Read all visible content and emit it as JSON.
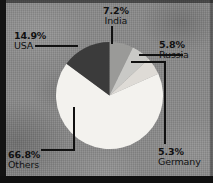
{
  "chart_data": {
    "type": "pie",
    "title": "",
    "subtitle": "",
    "xlabel": "",
    "ylabel": "",
    "legend_position": "none",
    "grid": false,
    "value_unit": "%",
    "start_angle_deg": 0,
    "direction": "clockwise",
    "categories": [
      "India",
      "Russia",
      "Germany",
      "Others",
      "USA"
    ],
    "values": [
      7.2,
      5.8,
      5.3,
      66.8,
      14.9
    ],
    "slices": [
      {
        "label": "India",
        "value": 7.2,
        "display": "7.2%",
        "color": "#9a9a98",
        "leader": "vertical-up"
      },
      {
        "label": "Russia",
        "value": 5.8,
        "display": "5.8%",
        "color": "#c9c9c6",
        "leader": "horizontal-right"
      },
      {
        "label": "Germany",
        "value": 5.3,
        "display": "5.3%",
        "color": "#dedbd6",
        "leader": "right-then-down"
      },
      {
        "label": "Others",
        "value": 66.8,
        "display": "66.8%",
        "color": "#f3f2ee",
        "leader": "down-then-left"
      },
      {
        "label": "USA",
        "value": 14.9,
        "display": "14.9%",
        "color": "#3b3b3b",
        "leader": "horizontal-left"
      }
    ]
  },
  "labels": {
    "india": {
      "pct": "7.2%",
      "name": "India"
    },
    "usa": {
      "pct": "14.9%",
      "name": "USA"
    },
    "russia": {
      "pct": "5.8%",
      "name": "Russia"
    },
    "germany": {
      "pct": "5.3%",
      "name": "Germany"
    },
    "others": {
      "pct": "66.8%",
      "name": "Others"
    }
  },
  "colors": {
    "background": "#8a8a8a",
    "frame": "#131313",
    "text": "#111111",
    "leader_line": "#111111"
  }
}
